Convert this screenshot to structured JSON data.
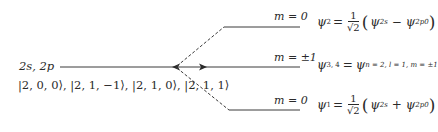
{
  "diagram": {
    "type": "energy-level-splitting",
    "left": {
      "level_label": "2s, 2p",
      "states_label": "|2, 0, 0⟩, |2, 1, −1⟩, |2, 1, 0⟩, |2, 1, 1⟩"
    },
    "levels": [
      {
        "position": "upper",
        "m_label": "m = 0",
        "psi": "ψ",
        "psi_sub": "2",
        "eq": "=",
        "frac_num": "1",
        "frac_den": "√2",
        "open": "(",
        "term1": "ψ",
        "term1_sub": "2s",
        "op": "−",
        "term2": "ψ",
        "term2_sub": "2p0",
        "close": ")"
      },
      {
        "position": "middle",
        "m_label": "m = ±1",
        "psi": "ψ",
        "psi_sub": "3, 4",
        "eq": "=",
        "rhs": "ψ",
        "rhs_sub": "n = 2, l = 1, m = ±1"
      },
      {
        "position": "lower",
        "m_label": "m = 0",
        "psi": "ψ",
        "psi_sub": "1",
        "eq": "=",
        "frac_num": "1",
        "frac_den": "√2",
        "open": "(",
        "term1": "ψ",
        "term1_sub": "2s",
        "op": "+",
        "term2": "ψ",
        "term2_sub": "2p0",
        "close": ")"
      }
    ],
    "colors": {
      "line": "#3a3a3a",
      "text": "#2a2a2a"
    }
  }
}
